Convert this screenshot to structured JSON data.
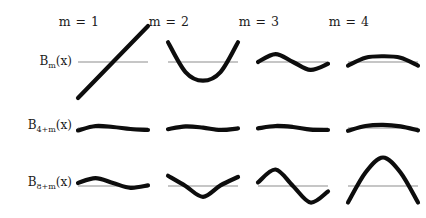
{
  "figure": {
    "title_cropped": "",
    "columns": [
      {
        "id": "m1",
        "label": "m = 1",
        "m": 1
      },
      {
        "id": "m2",
        "label": "m = 2",
        "m": 2
      },
      {
        "id": "m3",
        "label": "m = 3",
        "m": 3
      },
      {
        "id": "m4",
        "label": "m = 4",
        "m": 4
      }
    ],
    "rows": [
      {
        "id": "row1",
        "label": "B",
        "sub": "m",
        "suffix": "(x)",
        "label_full": "Bₘ(x)"
      },
      {
        "id": "row2",
        "label": "B",
        "sub": "4+m",
        "suffix": "(x)",
        "label_full": "B₄₊ₘ(x)"
      },
      {
        "id": "row3",
        "label": "B",
        "sub": "8+m",
        "suffix": "(x)",
        "label_full": "B₈₊ₘ(x)"
      }
    ],
    "colors": {
      "curve": "#0d0d0d",
      "axis": "#8d8d8d",
      "text": "#1b1b1b",
      "background": "#ffffff"
    }
  },
  "chart_data": {
    "type": "line",
    "title": "",
    "xlabel": "",
    "ylabel": "",
    "grid": false,
    "legend": "none",
    "xlim": [
      0,
      1
    ],
    "panels": [
      {
        "row": "B_m(x)",
        "col": "m = 1",
        "m": 1,
        "index": 1,
        "shape": "linear-increasing",
        "ylim": [
          -1,
          1
        ],
        "x": [
          0,
          0.25,
          0.5,
          0.75,
          1
        ],
        "y": [
          -1.0,
          -0.5,
          0.0,
          0.5,
          1.0
        ]
      },
      {
        "row": "B_m(x)",
        "col": "m = 2",
        "m": 2,
        "index": 2,
        "shape": "parabola-up",
        "ylim": [
          -1,
          1
        ],
        "x": [
          0,
          0.25,
          0.5,
          0.75,
          1
        ],
        "y": [
          0.55,
          -0.28,
          -0.52,
          -0.28,
          0.55
        ]
      },
      {
        "row": "B_m(x)",
        "col": "m = 3",
        "m": 3,
        "index": 3,
        "shape": "one-cycle-small",
        "ylim": [
          -1,
          1
        ],
        "x": [
          0,
          0.25,
          0.5,
          0.75,
          1
        ],
        "y": [
          0.0,
          0.22,
          0.0,
          -0.22,
          -0.05
        ]
      },
      {
        "row": "B_m(x)",
        "col": "m = 4",
        "m": 4,
        "index": 4,
        "shape": "shallow-bump-up",
        "ylim": [
          -1,
          1
        ],
        "x": [
          0,
          0.25,
          0.5,
          0.75,
          1
        ],
        "y": [
          -0.1,
          0.12,
          0.16,
          0.12,
          -0.1
        ]
      },
      {
        "row": "B_4+m(x)",
        "col": "m = 1",
        "m": 1,
        "index": 5,
        "shape": "gentle-wave",
        "ylim": [
          -1,
          1
        ],
        "x": [
          0,
          0.25,
          0.5,
          0.75,
          1
        ],
        "y": [
          -0.12,
          0.1,
          0.05,
          -0.05,
          -0.1
        ]
      },
      {
        "row": "B_4+m(x)",
        "col": "m = 2",
        "m": 2,
        "index": 6,
        "shape": "gentle-wave",
        "ylim": [
          -1,
          1
        ],
        "x": [
          0,
          0.25,
          0.5,
          0.75,
          1
        ],
        "y": [
          -0.06,
          0.08,
          0.02,
          -0.1,
          -0.02
        ]
      },
      {
        "row": "B_4+m(x)",
        "col": "m = 3",
        "m": 3,
        "index": 7,
        "shape": "gentle-wave",
        "ylim": [
          -1,
          1
        ],
        "x": [
          0,
          0.25,
          0.5,
          0.75,
          1
        ],
        "y": [
          -0.02,
          0.1,
          0.05,
          -0.08,
          -0.1
        ]
      },
      {
        "row": "B_4+m(x)",
        "col": "m = 4",
        "m": 4,
        "index": 8,
        "shape": "bump-up",
        "ylim": [
          -1,
          1
        ],
        "x": [
          0,
          0.25,
          0.5,
          0.75,
          1
        ],
        "y": [
          -0.14,
          0.1,
          0.16,
          0.08,
          -0.12
        ]
      },
      {
        "row": "B_8+m(x)",
        "col": "m = 1",
        "m": 1,
        "index": 9,
        "shape": "low-amplitude-sine",
        "ylim": [
          -1,
          1
        ],
        "x": [
          0,
          0.25,
          0.5,
          0.75,
          1
        ],
        "y": [
          0.1,
          0.26,
          0.1,
          -0.06,
          0.02
        ]
      },
      {
        "row": "B_8+m(x)",
        "col": "m = 2",
        "m": 2,
        "index": 10,
        "shape": "v-dip",
        "ylim": [
          -1,
          1
        ],
        "x": [
          0,
          0.25,
          0.5,
          0.75,
          1
        ],
        "y": [
          0.34,
          0.0,
          -0.36,
          0.02,
          0.3
        ]
      },
      {
        "row": "B_8+m(x)",
        "col": "m = 3",
        "m": 3,
        "index": 11,
        "shape": "full-sine",
        "ylim": [
          -1,
          1
        ],
        "x": [
          0,
          0.25,
          0.5,
          0.75,
          1
        ],
        "y": [
          0.12,
          0.55,
          0.0,
          -0.55,
          -0.18
        ]
      },
      {
        "row": "B_8+m(x)",
        "col": "m = 4",
        "m": 4,
        "index": 12,
        "shape": "large-hump",
        "ylim": [
          -1,
          1
        ],
        "x": [
          0,
          0.25,
          0.5,
          0.75,
          1
        ],
        "y": [
          -0.55,
          0.45,
          0.95,
          0.45,
          -0.55
        ]
      }
    ]
  }
}
